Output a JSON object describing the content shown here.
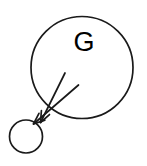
{
  "figure": {
    "name": "graph-node-diagram",
    "background_color": "#ffffff",
    "stroke_color": "#1a1a1a",
    "large_circle": {
      "label": "G",
      "cx": 82,
      "cy": 67.5,
      "r": 51,
      "stroke_width": 1.7
    },
    "small_circle": {
      "label": "",
      "cx": 26,
      "cy": 136.5,
      "r": 16.5,
      "stroke_width": 1.7
    },
    "arrows": [
      {
        "name": "arrow-upper",
        "x1": 65,
        "y1": 73,
        "x2": 40.5,
        "y2": 122.5,
        "stroke_width": 1.7,
        "head_length": 12,
        "head_angle": 22
      },
      {
        "name": "arrow-lower",
        "x1": 78.5,
        "y1": 85,
        "x2": 33.5,
        "y2": 124,
        "stroke_width": 1.7,
        "head_length": 12,
        "head_angle": 22
      }
    ]
  }
}
